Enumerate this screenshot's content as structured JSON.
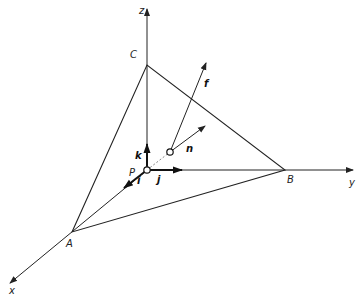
{
  "diagram": {
    "type": "3d-coordinate-system-with-plane-triangle",
    "axes": {
      "x": {
        "label": "x"
      },
      "y": {
        "label": "y"
      },
      "z": {
        "label": "z"
      }
    },
    "points": {
      "origin": {
        "label": "P"
      },
      "x_intercept": {
        "label": "A"
      },
      "y_intercept": {
        "label": "B"
      },
      "z_intercept": {
        "label": "C"
      }
    },
    "unit_vectors": {
      "i": {
        "label": "i"
      },
      "j": {
        "label": "j"
      },
      "k": {
        "label": "k"
      }
    },
    "plane_vectors": {
      "normal": {
        "label": "n"
      },
      "f": {
        "label": "f"
      }
    }
  },
  "colors": {
    "line": "#222222",
    "background": "#ffffff"
  }
}
